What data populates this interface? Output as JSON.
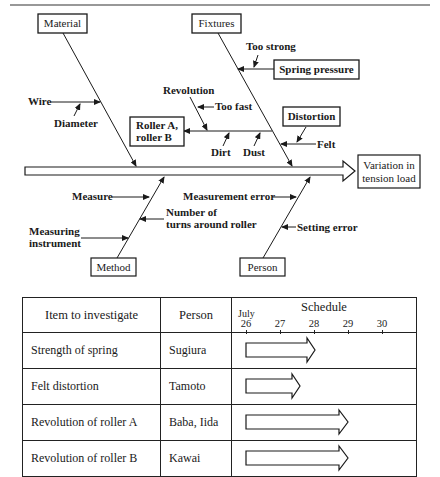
{
  "diagram": {
    "effect": [
      "Variation in",
      "tension load"
    ],
    "categories": {
      "material": "Material",
      "fixtures": "Fixtures",
      "method": "Method",
      "person": "Person"
    },
    "causes": {
      "wire": "Wire",
      "diameter": "Diameter",
      "revolution": "Revolution",
      "too_fast": "Too fast",
      "roller": [
        "Roller A,",
        "roller B"
      ],
      "dirt": "Dirt",
      "dust": "Dust",
      "too_strong": "Too strong",
      "spring_pressure": "Spring pressure",
      "distortion": "Distortion",
      "felt": "Felt",
      "measure": "Measure",
      "measuring_instrument": [
        "Measuring",
        "instrument"
      ],
      "number_of_turns": [
        "Number of",
        "turns around roller"
      ],
      "measurement_error": "Measurement error",
      "setting_error": "Setting error"
    }
  },
  "table": {
    "headers": {
      "item": "Item to investigate",
      "person": "Person",
      "schedule": "Schedule",
      "month": "July",
      "days": [
        "26",
        "27",
        "28",
        "29",
        "30"
      ]
    },
    "rows": [
      {
        "item": "Strength of spring",
        "person": "Sugiura",
        "start": "26",
        "end": "28"
      },
      {
        "item": "Felt distortion",
        "person": "Tamoto",
        "start": "26",
        "end": "27.5"
      },
      {
        "item": "Revolution of roller A",
        "person": "Baba, Iida",
        "start": "26",
        "end": "29"
      },
      {
        "item": "Revolution of roller B",
        "person": "Kawai",
        "start": "26",
        "end": "29"
      }
    ]
  }
}
